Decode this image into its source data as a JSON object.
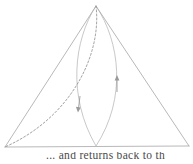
{
  "figure": {
    "kind": "geometry-diagram",
    "background_color": "#ffffff",
    "stroke_color": "#9a9a9a",
    "dashed_stroke_color": "#8a8a8a",
    "arrow_color": "#9a9a9a"
  },
  "triangle": {
    "name": "outer-triangle",
    "apex": {
      "x": 96,
      "y": 6
    },
    "bottom_left": {
      "x": 5,
      "y": 147
    },
    "bottom_right": {
      "x": 189,
      "y": 146
    },
    "stroke_width": 0.7
  },
  "vesica": {
    "name": "central-lens",
    "top": {
      "x": 96,
      "y": 6
    },
    "bottom": {
      "x": 96,
      "y": 146
    },
    "left_extent_x": 69,
    "right_extent_x": 126,
    "stroke_width": 0.7
  },
  "dashed_arc": {
    "name": "apex-to-left-corner-arc",
    "from": {
      "x": 96,
      "y": 6
    },
    "to": {
      "x": 5,
      "y": 147
    },
    "dash_pattern": "2 2",
    "stroke_width": 0.8
  },
  "arrows": [
    {
      "name": "arrow-right-up",
      "direction": "up",
      "x": 117,
      "y_tail": 92,
      "y_head": 76
    },
    {
      "name": "arrow-left-down",
      "direction": "down",
      "x": 79,
      "y_tail": 96,
      "y_head": 112
    }
  ],
  "caption": {
    "text": "... and returns back to th",
    "clipped": true
  }
}
